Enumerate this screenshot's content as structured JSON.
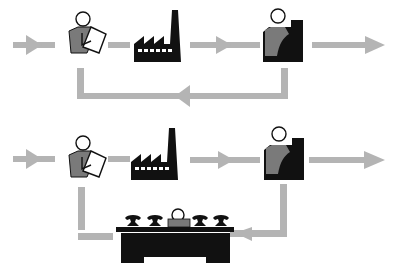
{
  "diagram": {
    "type": "process-flow",
    "colors": {
      "arrow": "#b4b4b4",
      "icon_dark": "#111111",
      "icon_mid": "#7a7a7a",
      "background": "#ffffff"
    },
    "rows": [
      {
        "id": "top",
        "nodes": [
          {
            "icon": "person-with-document-icon",
            "role": "clerk"
          },
          {
            "icon": "factory-icon",
            "role": "factory"
          },
          {
            "icon": "person-at-counter-icon",
            "role": "receiver"
          }
        ],
        "feedback": {
          "from": "receiver",
          "to": "clerk",
          "via": "direct"
        }
      },
      {
        "id": "bottom",
        "nodes": [
          {
            "icon": "person-with-document-icon",
            "role": "clerk"
          },
          {
            "icon": "factory-icon",
            "role": "factory"
          },
          {
            "icon": "person-at-counter-icon",
            "role": "receiver"
          }
        ],
        "feedback": {
          "from": "receiver",
          "to": "clerk",
          "via": "telephone-switchboard-desk-icon"
        }
      }
    ]
  }
}
